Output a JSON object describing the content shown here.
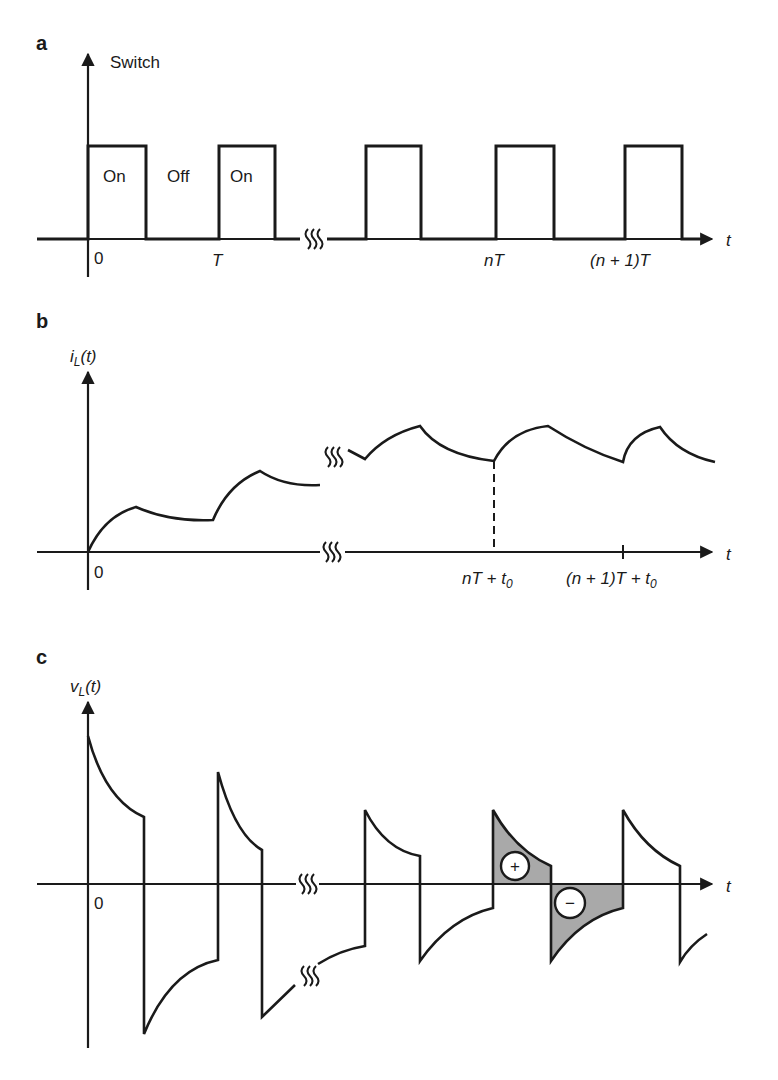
{
  "figure": {
    "panels": [
      {
        "letter": "a",
        "y_label": "Switch",
        "origin_label": "0",
        "state_labels": [
          "On",
          "Off",
          "On"
        ],
        "x_ticks": [
          "T",
          "nT",
          "(n + 1)T"
        ],
        "x_axis_label": "t"
      },
      {
        "letter": "b",
        "y_label_main": "i",
        "y_label_sub": "L",
        "y_label_tail": "(t)",
        "origin_label": "0",
        "x_ticks": [
          {
            "main": "nT + t",
            "sub": "0"
          },
          {
            "main": "(n + 1)T + t",
            "sub": "0"
          }
        ],
        "x_axis_label": "t"
      },
      {
        "letter": "c",
        "y_label_main": "v",
        "y_label_sub": "L",
        "y_label_tail": "(t)",
        "origin_label": "0",
        "area_markers": [
          "+",
          "−"
        ],
        "x_axis_label": "t"
      }
    ],
    "colors": {
      "line": "#1a1a1a",
      "shaded_area": "#a9a9a9",
      "background": "#ffffff"
    }
  }
}
